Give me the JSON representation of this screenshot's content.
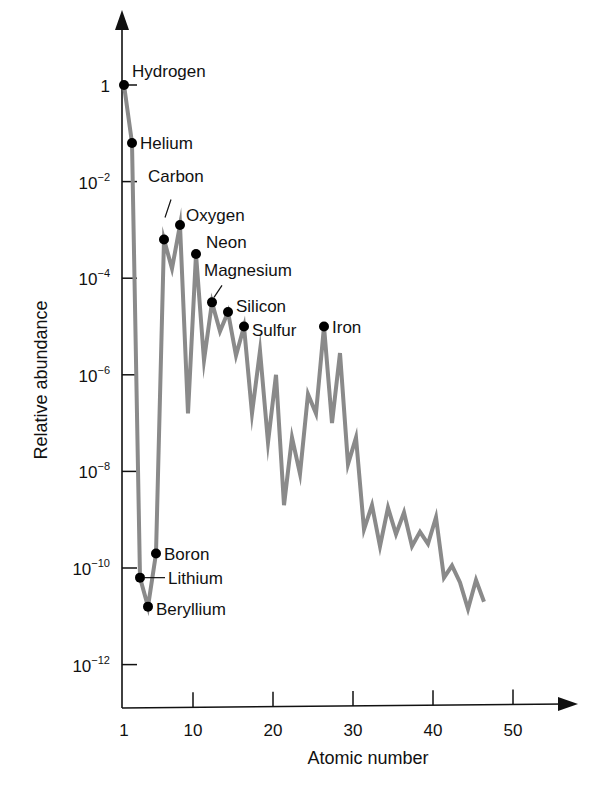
{
  "chart_data": {
    "type": "line",
    "title": "",
    "xlabel": "Atomic number",
    "ylabel": "Relative abundance",
    "yscale": "log",
    "xlim": [
      0,
      55
    ],
    "ylim": [
      1e-13,
      10
    ],
    "grid": false,
    "legend": null,
    "x_ticks": [
      {
        "value": 1,
        "label": "1"
      },
      {
        "value": 10,
        "label": "10"
      },
      {
        "value": 20,
        "label": "20"
      },
      {
        "value": 30,
        "label": "30"
      },
      {
        "value": 40,
        "label": "40"
      },
      {
        "value": 50,
        "label": "50"
      }
    ],
    "y_ticks": [
      {
        "exp": 0,
        "base": "1",
        "sup": ""
      },
      {
        "exp": -2,
        "base": "10",
        "sup": "−2"
      },
      {
        "exp": -4,
        "base": "10",
        "sup": "−4"
      },
      {
        "exp": -6,
        "base": "10",
        "sup": "−6"
      },
      {
        "exp": -8,
        "base": "10",
        "sup": "−8"
      },
      {
        "exp": -10,
        "base": "10",
        "sup": "−10"
      },
      {
        "exp": -12,
        "base": "10",
        "sup": "−12"
      }
    ],
    "series": [
      {
        "name": "Relative abundance",
        "color": "#8a8a8a",
        "x": [
          1,
          2,
          3,
          4,
          5,
          6,
          7,
          8,
          9,
          10,
          11,
          12,
          13,
          14,
          15,
          16,
          17,
          18,
          19,
          20,
          21,
          22,
          23,
          24,
          25,
          26,
          27,
          28,
          29,
          30,
          31,
          32,
          33,
          34,
          35,
          36,
          37,
          38,
          39,
          40,
          41,
          42,
          43,
          44,
          45,
          46
        ],
        "log10_values": [
          0,
          -1.2,
          -10.2,
          -10.8,
          -9.7,
          -3.2,
          -3.8,
          -2.9,
          -6.8,
          -3.5,
          -5.7,
          -4.5,
          -5.1,
          -4.7,
          -5.6,
          -5.0,
          -6.8,
          -5.5,
          -7.4,
          -6.0,
          -8.7,
          -7.3,
          -8.05,
          -6.4,
          -6.8,
          -5.0,
          -7.0,
          -5.55,
          -7.85,
          -7.3,
          -9.2,
          -8.7,
          -9.55,
          -8.75,
          -9.3,
          -8.85,
          -9.55,
          -9.25,
          -9.5,
          -8.95,
          -10.2,
          -9.95,
          -10.3,
          -10.85,
          -10.25,
          -10.7
        ]
      }
    ],
    "annotations": [
      {
        "element": "Hydrogen",
        "z": 1,
        "log10": 0,
        "dx": 8,
        "dy": -8
      },
      {
        "element": "Helium",
        "z": 2,
        "log10": -1.2,
        "dx": 8,
        "dy": 6
      },
      {
        "element": "Carbon",
        "z": 6,
        "log10": -3.2,
        "dx": -16,
        "dy": -58,
        "leader": true
      },
      {
        "element": "Oxygen",
        "z": 8,
        "log10": -2.9,
        "dx": 6,
        "dy": -4
      },
      {
        "element": "Neon",
        "z": 10,
        "log10": -3.5,
        "dx": 10,
        "dy": -6
      },
      {
        "element": "Magnesium",
        "z": 12,
        "log10": -4.5,
        "dx": -8,
        "dy": -26,
        "leader": true
      },
      {
        "element": "Silicon",
        "z": 14,
        "log10": -4.7,
        "dx": 8,
        "dy": 0
      },
      {
        "element": "Sulfur",
        "z": 16,
        "log10": -5.0,
        "dx": 8,
        "dy": 9
      },
      {
        "element": "Iron",
        "z": 26,
        "log10": -5.0,
        "dx": 8,
        "dy": 6
      },
      {
        "element": "Boron",
        "z": 5,
        "log10": -9.7,
        "dx": 8,
        "dy": 6
      },
      {
        "element": "Lithium",
        "z": 3,
        "log10": -10.2,
        "dx": 28,
        "dy": 6,
        "leader": true
      },
      {
        "element": "Beryllium",
        "z": 4,
        "log10": -10.8,
        "dx": 8,
        "dy": 8
      }
    ]
  },
  "axes": {
    "x_title": "Atomic number",
    "y_title": "Relative abundance"
  }
}
